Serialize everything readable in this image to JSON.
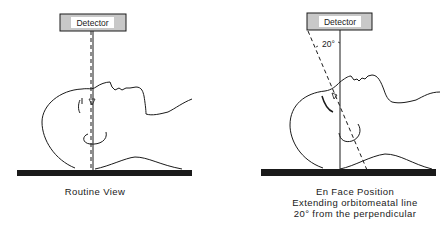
{
  "panels": [
    {
      "detector_label": "Detector",
      "caption_lines": [
        "Routine View"
      ]
    },
    {
      "detector_label": "Detector",
      "angle_label": "20°",
      "caption_lines": [
        "En Face Position",
        "Extending orbitomeatal line",
        "20° from the perpendicular"
      ]
    }
  ],
  "colors": {
    "ink": "#1a1a1a",
    "detector_fill": "#c8c8c8",
    "detector_label_bg": "#ffffff"
  }
}
